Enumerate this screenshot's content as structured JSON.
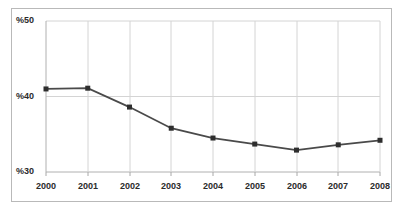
{
  "chart_data": {
    "type": "line",
    "title": "",
    "subtitle": "",
    "xlabel": "",
    "ylabel": "",
    "categories": [
      "2000",
      "2001",
      "2002",
      "2003",
      "2004",
      "2005",
      "2006",
      "2007",
      "2008"
    ],
    "values": [
      41.0,
      41.1,
      38.6,
      35.8,
      34.5,
      33.7,
      32.9,
      33.6,
      34.2
    ],
    "series": [
      {
        "name": "",
        "values": [
          41.0,
          41.1,
          38.6,
          35.8,
          34.5,
          33.7,
          32.9,
          33.6,
          34.2
        ]
      }
    ],
    "ylim": [
      30,
      50
    ],
    "xlim": [
      "2000",
      "2008"
    ],
    "y_tick_labels": [
      "%50",
      "%40",
      "%30"
    ],
    "y_tick_values": [
      50,
      40,
      30
    ],
    "x_tick_labels": [
      "2000",
      "2001",
      "2002",
      "2003",
      "2004",
      "2005",
      "2006",
      "2007",
      "2008"
    ],
    "grid": {
      "horizontal": true,
      "vertical": true
    },
    "legend": {
      "visible": false,
      "position": "none",
      "entries": []
    },
    "marker": "square",
    "annotations": []
  },
  "style": {
    "series_color": "#4a4a4a",
    "marker_color": "#2e2e2e",
    "grid_color": "#d4d4d4",
    "axis_color": "#a8a8a8",
    "frame_color": "#b9b9b9",
    "tick_label_color": "#2b2b2b",
    "background": "#ffffff"
  }
}
